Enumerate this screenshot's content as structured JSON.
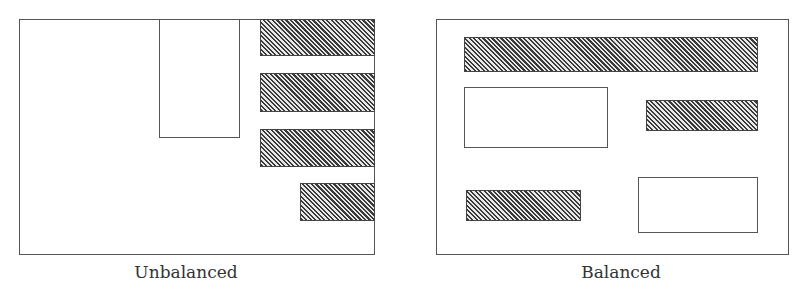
{
  "figure": {
    "panels": [
      {
        "id": "unbalanced",
        "caption": "Unbalanced",
        "elements": [
          {
            "type": "plain",
            "description": "white rectangle"
          },
          {
            "type": "hatched",
            "description": "hatched bar 1"
          },
          {
            "type": "hatched",
            "description": "hatched bar 2"
          },
          {
            "type": "hatched",
            "description": "hatched bar 3"
          },
          {
            "type": "hatched",
            "description": "hatched bar 4 (short)"
          }
        ]
      },
      {
        "id": "balanced",
        "caption": "Balanced",
        "elements": [
          {
            "type": "hatched",
            "description": "wide hatched top bar"
          },
          {
            "type": "plain",
            "description": "white rectangle left"
          },
          {
            "type": "hatched",
            "description": "hatched bar right"
          },
          {
            "type": "hatched",
            "description": "hatched bar bottom-left"
          },
          {
            "type": "plain",
            "description": "white rectangle bottom-right"
          }
        ]
      }
    ],
    "colors": {
      "border": "#555555",
      "hatch_dark": "#3a3a3a",
      "hatch_light": "#e8e8e8",
      "background": "#ffffff"
    }
  }
}
